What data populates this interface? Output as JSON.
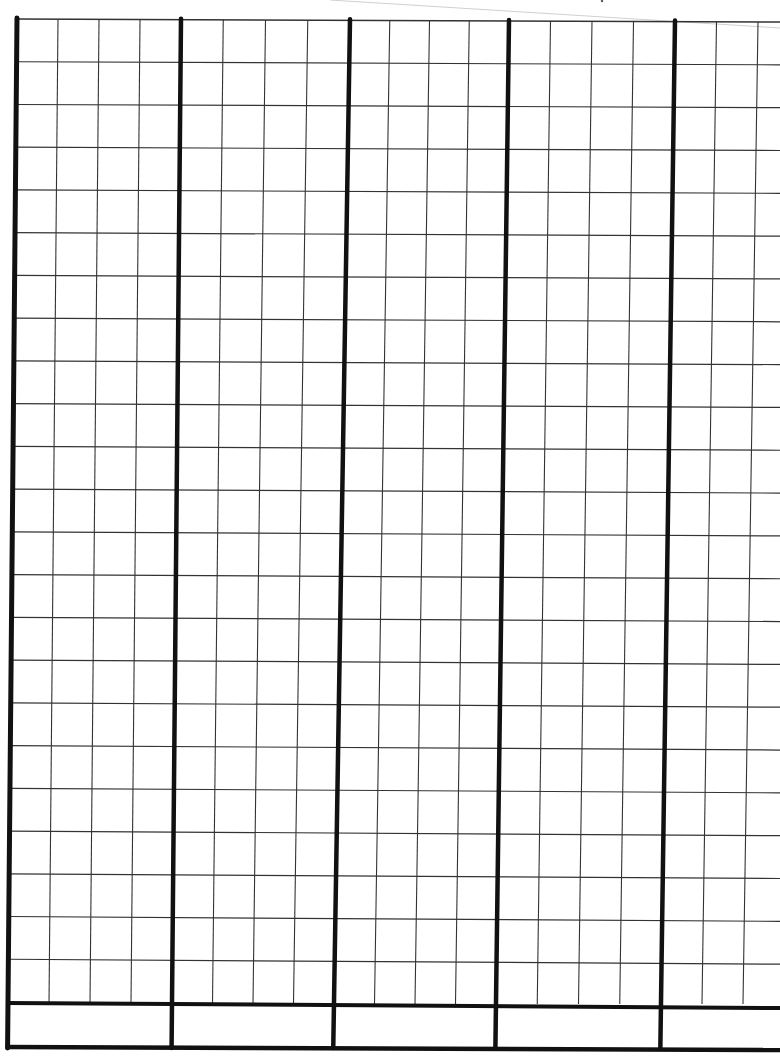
{
  "document": {
    "type": "blank graph paper form",
    "grid": {
      "major_columns": 5,
      "cells_per_major_column": 4,
      "visible_partial_cells_right": 2,
      "rows": 23,
      "footer_rows": 1,
      "top_left": [
        17,
        19
      ],
      "top_right_y": 22,
      "bottom_left": [
        8,
        1002
      ],
      "cell_width": 41.5,
      "cell_height": 42.7,
      "major_x_top": [
        17,
        181,
        350,
        509,
        675
      ],
      "major_x_bottom": [
        8,
        172,
        334,
        496,
        661
      ],
      "footer_bottom_y": 1048,
      "colors": {
        "paper": "#ffffff",
        "ink": "#111111",
        "thin_line": "#333333",
        "page_edge": "#d0d0d0"
      }
    },
    "footer_cells": [
      "",
      "",
      "",
      "",
      ""
    ],
    "text_content": []
  }
}
